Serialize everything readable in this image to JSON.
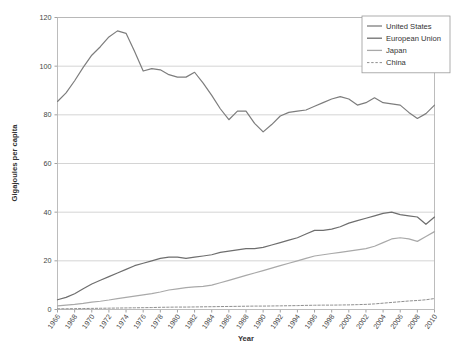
{
  "chart_data": {
    "type": "line",
    "title": "",
    "xlabel": "Year",
    "ylabel": "Gigajoules per capita",
    "xlim": [
      1965,
      2011
    ],
    "ylim": [
      0,
      120
    ],
    "ytick_step": 20,
    "grid": true,
    "legend_position": "top-right",
    "yticks": [
      "0",
      "20",
      "40",
      "60",
      "80",
      "100",
      "120"
    ],
    "categories": [
      "1966",
      "1967",
      "1968",
      "1969",
      "1970",
      "1971",
      "1972",
      "1973",
      "1974",
      "1975",
      "1976",
      "1977",
      "1978",
      "1979",
      "1980",
      "1981",
      "1982",
      "1983",
      "1984",
      "1985",
      "1986",
      "1987",
      "1988",
      "1989",
      "1990",
      "1991",
      "1992",
      "1993",
      "1994",
      "1995",
      "1996",
      "1997",
      "1998",
      "1999",
      "2000",
      "2001",
      "2002",
      "2003",
      "2004",
      "2005",
      "2006",
      "2007",
      "2008",
      "2009",
      "2010"
    ],
    "xtick_labels": [
      "1966",
      "1968",
      "1970",
      "1972",
      "1974",
      "1976",
      "1978",
      "1980",
      "1982",
      "1984",
      "1986",
      "1988",
      "1990",
      "1992",
      "1994",
      "1996",
      "1998",
      "2000",
      "2002",
      "2004",
      "2006",
      "2008",
      "2010"
    ],
    "series": [
      {
        "name": "United States",
        "color": "#7d7d7d",
        "dash": "none",
        "values": [
          85.5,
          89.0,
          94.0,
          99.5,
          104.5,
          108.0,
          112.0,
          114.5,
          113.5,
          106.0,
          98.0,
          99.0,
          98.5,
          96.5,
          95.5,
          95.5,
          97.5,
          93.0,
          88.0,
          82.5,
          78.0,
          81.5,
          81.5,
          76.5,
          73.0,
          76.0,
          79.5,
          81.0,
          81.5,
          82.0,
          83.5,
          85.0,
          86.5,
          87.5,
          86.5,
          84.0,
          85.0,
          87.0,
          85.0,
          84.5,
          84.0,
          81.0,
          78.5,
          80.5,
          84.0
        ]
      },
      {
        "name": "European Union",
        "color": "#6e6e6e",
        "dash": "none",
        "values": [
          4.0,
          5.0,
          6.5,
          8.5,
          10.5,
          12.0,
          13.5,
          15.0,
          16.5,
          18.0,
          19.0,
          20.0,
          21.0,
          21.5,
          21.5,
          21.0,
          21.5,
          22.0,
          22.5,
          23.5,
          24.0,
          24.5,
          25.0,
          25.0,
          25.5,
          26.5,
          27.5,
          28.5,
          29.5,
          31.0,
          32.5,
          32.5,
          33.0,
          34.0,
          35.5,
          36.5,
          37.5,
          38.5,
          39.5,
          40.0,
          39.0,
          38.5,
          38.0,
          35.0,
          38.0
        ]
      },
      {
        "name": "Japan",
        "color": "#a9a9a9",
        "dash": "none",
        "values": [
          1.5,
          1.8,
          2.1,
          2.5,
          3.0,
          3.4,
          3.9,
          4.5,
          5.0,
          5.5,
          6.0,
          6.5,
          7.2,
          8.0,
          8.5,
          9.0,
          9.3,
          9.5,
          10.0,
          11.0,
          12.0,
          13.0,
          14.0,
          15.0,
          16.0,
          17.0,
          18.0,
          19.0,
          20.0,
          21.0,
          22.0,
          22.5,
          23.0,
          23.5,
          24.0,
          24.5,
          25.0,
          26.0,
          27.5,
          29.0,
          29.5,
          29.0,
          28.0,
          30.0,
          32.0
        ]
      },
      {
        "name": "China",
        "color": "#8f8f8f",
        "dash": "dashed",
        "values": [
          0.3,
          0.3,
          0.35,
          0.4,
          0.45,
          0.5,
          0.55,
          0.6,
          0.65,
          0.7,
          0.75,
          0.8,
          0.9,
          0.95,
          1.0,
          1.0,
          1.05,
          1.1,
          1.15,
          1.2,
          1.25,
          1.3,
          1.35,
          1.4,
          1.4,
          1.45,
          1.5,
          1.55,
          1.6,
          1.7,
          1.75,
          1.8,
          1.8,
          1.85,
          1.9,
          2.0,
          2.1,
          2.3,
          2.6,
          2.9,
          3.2,
          3.5,
          3.7,
          4.0,
          4.5
        ]
      }
    ]
  },
  "legend": {
    "items": [
      {
        "label": "United States"
      },
      {
        "label": "European Union"
      },
      {
        "label": "Japan"
      },
      {
        "label": "China"
      }
    ]
  }
}
